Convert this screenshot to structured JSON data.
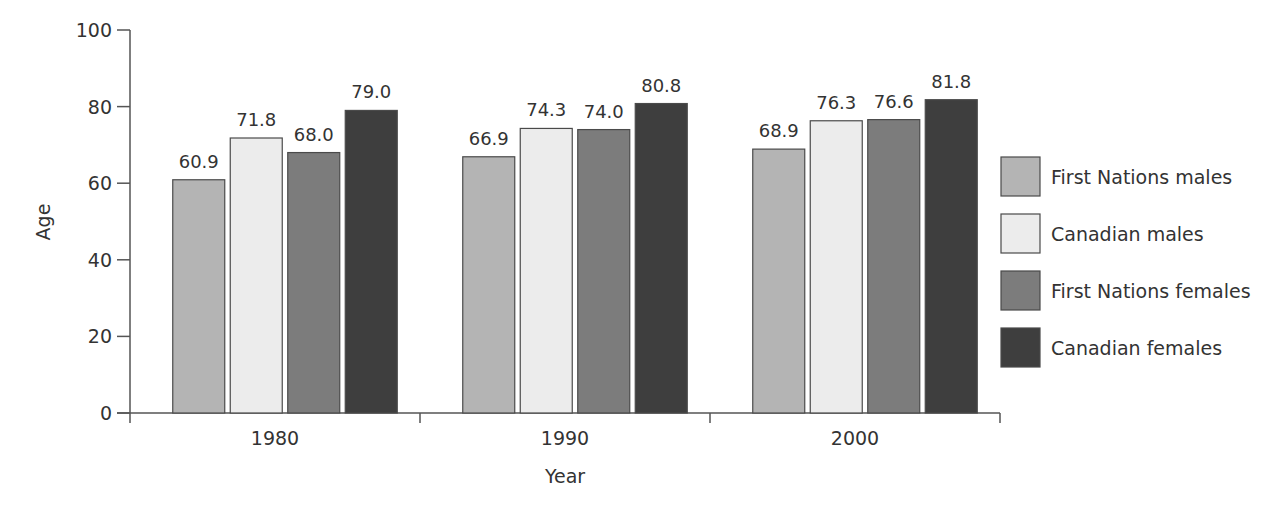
{
  "chart_data": {
    "type": "bar",
    "title": "",
    "xlabel": "Year",
    "ylabel": "Age",
    "ylim": [
      0,
      100
    ],
    "yticks": [
      0,
      20,
      40,
      60,
      80,
      100
    ],
    "grid": false,
    "legend_position": "right",
    "categories": [
      "1980",
      "1990",
      "2000"
    ],
    "series": [
      {
        "name": "First Nations males",
        "values": [
          60.9,
          66.9,
          68.9
        ],
        "labels": [
          "60.9",
          "66.9",
          "68.9"
        ],
        "color": "#b4b4b4"
      },
      {
        "name": "Canadian males",
        "values": [
          71.8,
          74.3,
          76.3
        ],
        "labels": [
          "71.8",
          "74.3",
          "76.3"
        ],
        "color": "#ececec"
      },
      {
        "name": "First Nations females",
        "values": [
          68.0,
          74.0,
          76.6
        ],
        "labels": [
          "68.0",
          "74.0",
          "76.6"
        ],
        "color": "#7c7c7c"
      },
      {
        "name": "Canadian females",
        "values": [
          79.0,
          80.8,
          81.8
        ],
        "labels": [
          "79.0",
          "80.8",
          "81.8"
        ],
        "color": "#3e3e3e"
      }
    ]
  },
  "axis": {
    "x_title": "Year",
    "y_title": "Age"
  }
}
